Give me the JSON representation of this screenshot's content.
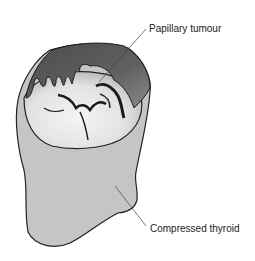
{
  "diagram": {
    "labels": [
      {
        "id": "papillary-tumour",
        "text": "Papillary tumour"
      },
      {
        "id": "compressed-thyroid",
        "text": "Compressed thyroid"
      }
    ],
    "colors": {
      "outline": "#222222",
      "tumour_dark": "#5a5a5a",
      "tumour_light": "#ececec",
      "thyroid_mottle": "#9a9a9a",
      "leader_line": "#444444"
    }
  }
}
